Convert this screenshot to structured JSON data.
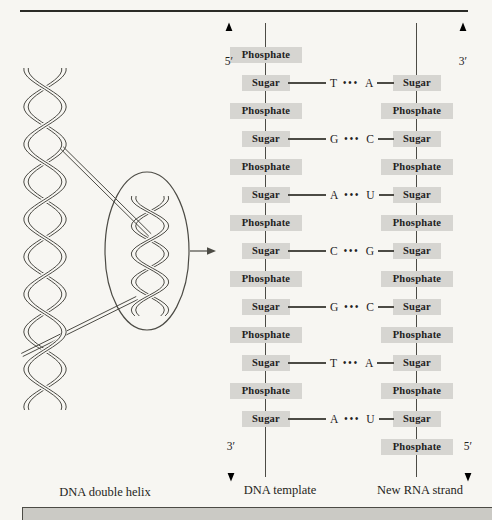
{
  "figure_title": "DNA transcription diagram",
  "helix_panel": {
    "caption": "DNA double helix"
  },
  "dna_template": {
    "caption": "DNA template",
    "top_label": "5′",
    "bottom_label": "3′",
    "units": [
      "Phosphate",
      "Sugar",
      "Phosphate",
      "Sugar",
      "Phosphate",
      "Sugar",
      "Phosphate",
      "Sugar",
      "Phosphate",
      "Sugar",
      "Phosphate",
      "Sugar",
      "Phosphate",
      "Sugar"
    ]
  },
  "rna_strand": {
    "caption": "New RNA strand",
    "top_label": "3′",
    "bottom_label": "5′",
    "units": [
      "Sugar",
      "Phosphate",
      "Sugar",
      "Phosphate",
      "Sugar",
      "Phosphate",
      "Sugar",
      "Phosphate",
      "Sugar",
      "Phosphate",
      "Sugar",
      "Phosphate",
      "Sugar",
      "Phosphate"
    ]
  },
  "base_pairs": [
    {
      "dna": "T",
      "bond": "•••",
      "rna": "A"
    },
    {
      "dna": "G",
      "bond": "•••",
      "rna": "C"
    },
    {
      "dna": "A",
      "bond": "•••",
      "rna": "U"
    },
    {
      "dna": "C",
      "bond": "•••",
      "rna": "G"
    },
    {
      "dna": "G",
      "bond": "•••",
      "rna": "C"
    },
    {
      "dna": "T",
      "bond": "•••",
      "rna": "A"
    },
    {
      "dna": "A",
      "bond": "•••",
      "rna": "U"
    }
  ],
  "colors": {
    "background": "#f7f6f2",
    "box_fill": "#d6d5d1",
    "line": "#4c4b45",
    "ink": "#22211d",
    "rule": "#2b2b27",
    "bottom_bar": "#cbcac5"
  }
}
